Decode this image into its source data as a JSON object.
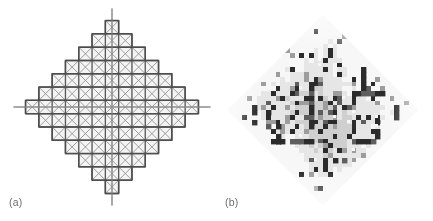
{
  "figure": {
    "width": 433,
    "height": 221,
    "background": "#ffffff",
    "panels": [
      {
        "id": "panel-a",
        "label": "(a)",
        "kind": "mesh",
        "description": "Diamond-shaped structured quadrilateral mesh, each cell crossed by both diagonals, with horizontal and vertical centre axis lines protruding past the diamond tips",
        "center": [
          112,
          107
        ],
        "cell_size": 13.3,
        "half_span_cells": 6.5,
        "row_counts": [
          1,
          3,
          5,
          7,
          9,
          11,
          13,
          11,
          9,
          7,
          5,
          3,
          1
        ],
        "line_color": "#5a5a5a",
        "diagonal_color": "#8e8e8e",
        "cell_fill": "#f4f4f4",
        "axis_color": "#9a9a9a",
        "axis_overshoot": 12,
        "line_width": 1.35,
        "diagonal_width": 0.85
      },
      {
        "id": "panel-b",
        "label": "(b)",
        "kind": "heatmap",
        "description": "Diamond-shaped (45-degree rotated) grayscale cell-wise scalar field / error indicator map on the same lattice; dark cells mark flagged elements",
        "center": [
          107,
          110
        ],
        "half_diagonal": 95,
        "grid_cells": 40,
        "cell_size": 4.75,
        "colors": {
          "dark": "#2b2b2b",
          "mid_dark": "#5e5e5e",
          "mid": "#9d9d9d",
          "light": "#cfcfcf",
          "lighter": "#e6e6e6",
          "white": "#f7f7f7",
          "outside": "#ffffff"
        },
        "noise_seed": 20240617
      }
    ]
  },
  "chart_data": [
    {
      "type": "diagram",
      "title": "(a)",
      "subtitle": "structured diamond mesh with diagonals",
      "xlabel": "",
      "ylabel": "",
      "grid": true,
      "legend": "none",
      "categories": [
        "row 1",
        "row 2",
        "row 3",
        "row 4",
        "row 5",
        "row 6",
        "row 7",
        "row 8",
        "row 9",
        "row 10",
        "row 11",
        "row 12",
        "row 13"
      ],
      "values": [
        1,
        3,
        5,
        7,
        9,
        11,
        13,
        11,
        9,
        7,
        5,
        3,
        1
      ],
      "notes": "cells per staircase row forming the rotated-square (diamond) domain; total cells = 85"
    },
    {
      "type": "heatmap",
      "title": "(b)",
      "subtitle": "grayscale scalar field on the diamond domain",
      "xlabel": "",
      "ylabel": "",
      "grid": false,
      "legend": "none",
      "ncols": 40,
      "nrows": 40,
      "zlim": [
        0,
        1
      ],
      "notes": "binary-dominant speckle pattern: dark (value near 1) cells clustered centrally, light (value near 0) cells toward the diamond tips"
    }
  ]
}
